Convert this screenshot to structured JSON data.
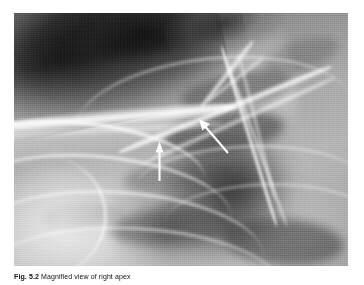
{
  "figure": {
    "caption_label": "Fig. 5.2",
    "caption_text": "Magnified view of right apex",
    "caption_full": "Fig. 5.2 Magnified view of right apex",
    "modality": "chest-radiograph",
    "region": "right apex",
    "background_color": "#ffffff"
  },
  "radiograph": {
    "alt": "Magnified chest radiograph of the right lung apex showing clavicle, scapular border and rib arcs with two white annotation arrows",
    "frame": {
      "left": 14,
      "top": 13,
      "width": 334,
      "height": 253
    },
    "tones": {
      "lung_apex_dark": "#101010",
      "film_midtone": "#9a9a9a",
      "bone_bright": "#ffffff",
      "mediastinum_shadow": "#4a4a4a"
    }
  },
  "annotations": {
    "arrow_color": "#ffffff",
    "items": [
      {
        "id": "arrow-vertical",
        "label": "vertical arrow",
        "direction": "up",
        "tail_x": 159,
        "tail_y": 181,
        "tip_x": 159,
        "tip_y": 143
      },
      {
        "id": "arrow-diagonal",
        "label": "diagonal arrow",
        "direction": "up-left",
        "tail_x": 228,
        "tail_y": 153,
        "tip_x": 199,
        "tip_y": 119
      }
    ]
  }
}
